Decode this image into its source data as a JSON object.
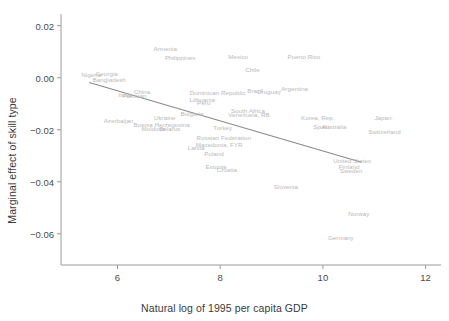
{
  "chart_data": {
    "type": "scatter",
    "title": "",
    "xlabel": "Natural log of 1995 per capita GDP",
    "ylabel": "Marginal effect of skill type",
    "xlim": [
      4.9,
      12.3
    ],
    "ylim": [
      -0.072,
      0.0245
    ],
    "xticks": [
      6,
      8,
      10,
      12
    ],
    "xtick_labels": [
      "6",
      "8",
      "10",
      "12"
    ],
    "yticks": [
      0.02,
      0.0,
      -0.02,
      -0.04,
      -0.06
    ],
    "ytick_labels": [
      "0.02",
      "0.00",
      "-0.02",
      "-0.04",
      "-0.06"
    ],
    "grid": false,
    "legend": "none",
    "marker_style": "text-label-only",
    "label_color": "#b9b9b9",
    "axis_color": "#9a9a9a",
    "fit_line": {
      "type": "linear",
      "color": "#8a8a8a",
      "x_start": 5.45,
      "y_start": -0.0018,
      "x_end": 10.75,
      "y_end": -0.0325
    },
    "points": [
      {
        "label": "Armenia",
        "x": 6.93,
        "y": 0.0113
      },
      {
        "label": "Philippines",
        "x": 7.22,
        "y": 0.0078
      },
      {
        "label": "Mexico",
        "x": 8.35,
        "y": 0.0084
      },
      {
        "label": "Puerto Rico",
        "x": 9.63,
        "y": 0.0084
      },
      {
        "label": "Chile",
        "x": 8.63,
        "y": 0.0035
      },
      {
        "label": "Nigeria",
        "x": 5.49,
        "y": 0.0016
      },
      {
        "label": "Georgia",
        "x": 5.79,
        "y": 0.0017
      },
      {
        "label": "Bangladesh",
        "x": 5.84,
        "y": -0.0003
      },
      {
        "label": "Argentina",
        "x": 9.45,
        "y": -0.0039
      },
      {
        "label": "Brazil",
        "x": 8.68,
        "y": -0.0046
      },
      {
        "label": "Uruguay",
        "x": 8.95,
        "y": -0.0052
      },
      {
        "label": "Dominican Republic",
        "x": 7.95,
        "y": -0.0053
      },
      {
        "label": "China",
        "x": 6.48,
        "y": -0.005
      },
      {
        "label": "India",
        "x": 6.15,
        "y": -0.0064
      },
      {
        "label": "Pakistan",
        "x": 6.33,
        "y": -0.0066
      },
      {
        "label": "Lithuania",
        "x": 7.65,
        "y": -0.008
      },
      {
        "label": "Peru",
        "x": 7.68,
        "y": -0.0094
      },
      {
        "label": "South Africa",
        "x": 8.54,
        "y": -0.0124
      },
      {
        "label": "Venezuela, RB",
        "x": 8.56,
        "y": -0.014
      },
      {
        "label": "Bulgaria",
        "x": 7.45,
        "y": -0.0136
      },
      {
        "label": "Ukraine",
        "x": 6.92,
        "y": -0.0152
      },
      {
        "label": "Korea, Rep.",
        "x": 9.9,
        "y": -0.0152
      },
      {
        "label": "Japan",
        "x": 11.17,
        "y": -0.0151
      },
      {
        "label": "Azerbaijan",
        "x": 6.02,
        "y": -0.0161
      },
      {
        "label": "Bosnia Herzegovina",
        "x": 6.86,
        "y": -0.0176
      },
      {
        "label": "Spain",
        "x": 9.97,
        "y": -0.0187
      },
      {
        "label": "Australia",
        "x": 10.22,
        "y": -0.0187
      },
      {
        "label": "Turkey",
        "x": 8.05,
        "y": -0.019
      },
      {
        "label": "Moldova",
        "x": 6.7,
        "y": -0.0192
      },
      {
        "label": "Belarus",
        "x": 7.02,
        "y": -0.0192
      },
      {
        "label": "Switzerland",
        "x": 11.2,
        "y": -0.0203
      },
      {
        "label": "Russian Federation",
        "x": 8.07,
        "y": -0.0228
      },
      {
        "label": "Macedonia, FYR",
        "x": 7.98,
        "y": -0.0254
      },
      {
        "label": "Latvia",
        "x": 7.53,
        "y": -0.0268
      },
      {
        "label": "Poland",
        "x": 7.88,
        "y": -0.0288
      },
      {
        "label": "United States",
        "x": 10.57,
        "y": -0.0315
      },
      {
        "label": "Estonia",
        "x": 7.92,
        "y": -0.034
      },
      {
        "label": "Croatia",
        "x": 8.13,
        "y": -0.0352
      },
      {
        "label": "Finland",
        "x": 10.51,
        "y": -0.034
      },
      {
        "label": "Sweden",
        "x": 10.55,
        "y": -0.0355
      },
      {
        "label": "Slovenia",
        "x": 9.28,
        "y": -0.0418
      },
      {
        "label": "Norway",
        "x": 10.7,
        "y": -0.052
      },
      {
        "label": "Germany",
        "x": 10.35,
        "y": -0.0612
      }
    ]
  }
}
